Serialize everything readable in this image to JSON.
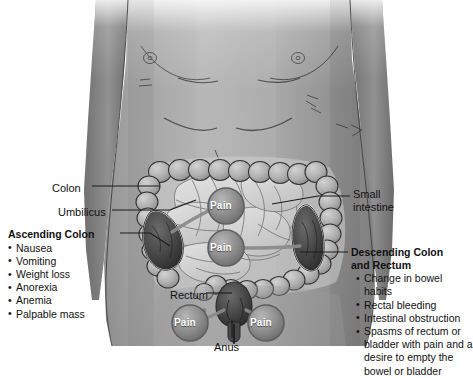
{
  "figure": {
    "background_color": "#ffffff"
  },
  "labels": {
    "colon": "Colon",
    "umbilicus": "Umbilicus",
    "small_intestine": "Small intestine",
    "rectum": "Rectum",
    "anus": "Anus",
    "pain": "Pain"
  },
  "pain_markers": [
    {
      "id": "pain-upper-abdomen",
      "label": "Pain",
      "x": 226,
      "y": 206
    },
    {
      "id": "pain-lower-abdomen",
      "label": "Pain",
      "x": 226,
      "y": 248
    },
    {
      "id": "pain-perineum-left",
      "label": "Pain",
      "x": 190,
      "y": 323
    },
    {
      "id": "pain-perineum-right",
      "label": "Pain",
      "x": 266,
      "y": 323
    }
  ],
  "panels": {
    "left": {
      "heading": "Ascending Colon",
      "items": [
        "Nausea",
        "Vomiting",
        "Weight loss",
        "Anorexia",
        "Anemia",
        "Palpable mass"
      ]
    },
    "right": {
      "heading_line1": "Descending Colon",
      "heading_line2": "and Rectum",
      "items": [
        "Change in bowel habits",
        "Rectal bleeding",
        "Intestinal obstruction",
        "Spasms of rectum or bladder with pain and a desire to empty the bowel or bladder"
      ]
    }
  },
  "colors": {
    "skin_light": "#b9b9b9",
    "skin_mid": "#949494",
    "skin_dark": "#6f6f6f",
    "colon_fill": "#b0b0b0",
    "colon_outline": "#3a3a3a",
    "small_intestine_fill": "#d8d8d8",
    "tumor_fill": "#4a4a4a",
    "pain_circle_fill": "#8e8e8e",
    "pain_circle_rim": "#6a6a6a",
    "pain_text": "#ffffff",
    "leader_line": "#1a1a1a",
    "text": "#111111"
  }
}
